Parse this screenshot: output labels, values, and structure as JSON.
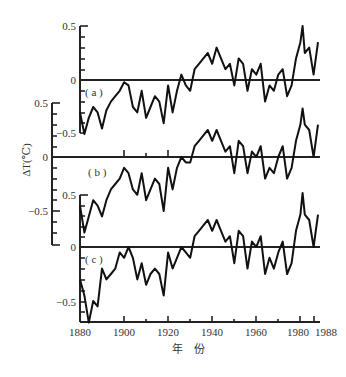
{
  "chart_data": {
    "type": "line",
    "title": "",
    "xlabel": "年　份",
    "ylabel": "ΔT(℃)",
    "x_ticks": [
      "1880",
      "1900",
      "1920",
      "1940",
      "1960",
      "1980",
      "1988"
    ],
    "xlim": [
      1880,
      1988
    ],
    "grid": false,
    "legend": null,
    "panels": [
      {
        "label": "(a)",
        "y_ticks": [
          "0.5",
          "0",
          "-0.5"
        ],
        "ylim": [
          -0.5,
          0.5
        ],
        "x": [
          1880,
          1882,
          1884,
          1886,
          1888,
          1890,
          1892,
          1894,
          1896,
          1898,
          1900,
          1902,
          1904,
          1906,
          1908,
          1910,
          1912,
          1914,
          1916,
          1918,
          1920,
          1922,
          1924,
          1926,
          1928,
          1930,
          1932,
          1934,
          1936,
          1938,
          1940,
          1942,
          1944,
          1946,
          1948,
          1950,
          1952,
          1954,
          1956,
          1958,
          1960,
          1962,
          1964,
          1966,
          1968,
          1970,
          1972,
          1974,
          1976,
          1978,
          1980,
          1981,
          1982,
          1984,
          1986,
          1988
        ],
        "values": [
          -0.3,
          -0.5,
          -0.35,
          -0.25,
          -0.3,
          -0.45,
          -0.28,
          -0.2,
          -0.15,
          -0.1,
          -0.02,
          -0.05,
          -0.25,
          -0.3,
          -0.1,
          -0.35,
          -0.25,
          -0.15,
          -0.2,
          -0.4,
          -0.05,
          -0.3,
          -0.1,
          0.05,
          -0.05,
          -0.1,
          0.1,
          0.15,
          0.2,
          0.25,
          0.15,
          0.3,
          0.2,
          0.1,
          0.15,
          -0.05,
          0.2,
          0.15,
          -0.1,
          0.1,
          0.05,
          0.15,
          -0.2,
          -0.05,
          -0.1,
          0.05,
          0.1,
          -0.15,
          -0.05,
          0.2,
          0.35,
          0.5,
          0.25,
          0.3,
          0.05,
          0.35
        ]
      },
      {
        "label": "(b)",
        "y_ticks": [
          "0.5",
          "0",
          "-0.5"
        ],
        "ylim": [
          -0.5,
          0.5
        ],
        "x": [
          1880,
          1882,
          1884,
          1886,
          1888,
          1890,
          1892,
          1894,
          1896,
          1898,
          1900,
          1902,
          1904,
          1906,
          1908,
          1910,
          1912,
          1914,
          1916,
          1918,
          1920,
          1922,
          1924,
          1926,
          1928,
          1930,
          1932,
          1934,
          1936,
          1938,
          1940,
          1942,
          1944,
          1946,
          1948,
          1950,
          1952,
          1954,
          1956,
          1958,
          1960,
          1962,
          1964,
          1966,
          1968,
          1970,
          1972,
          1974,
          1976,
          1978,
          1980,
          1981,
          1982,
          1984,
          1986,
          1988
        ],
        "values": [
          -0.45,
          -0.7,
          -0.55,
          -0.4,
          -0.45,
          -0.55,
          -0.4,
          -0.3,
          -0.25,
          -0.2,
          -0.1,
          -0.15,
          -0.3,
          -0.35,
          -0.15,
          -0.4,
          -0.3,
          -0.2,
          -0.25,
          -0.5,
          -0.1,
          -0.3,
          -0.1,
          0.0,
          -0.05,
          -0.05,
          0.1,
          0.15,
          0.2,
          0.25,
          0.15,
          0.25,
          0.15,
          0.05,
          0.1,
          -0.15,
          0.15,
          0.1,
          -0.15,
          0.05,
          0.0,
          0.1,
          -0.2,
          -0.1,
          -0.15,
          0.0,
          0.1,
          -0.2,
          -0.1,
          0.15,
          0.3,
          0.45,
          0.3,
          0.25,
          0.0,
          0.3
        ]
      },
      {
        "label": "(c)",
        "y_ticks": [
          "0.5",
          "0",
          "-0.5"
        ],
        "ylim": [
          -0.7,
          0.5
        ],
        "x": [
          1880,
          1882,
          1884,
          1886,
          1888,
          1890,
          1892,
          1894,
          1896,
          1898,
          1900,
          1902,
          1904,
          1906,
          1908,
          1910,
          1912,
          1914,
          1916,
          1918,
          1920,
          1922,
          1924,
          1926,
          1928,
          1930,
          1932,
          1934,
          1936,
          1938,
          1940,
          1942,
          1944,
          1946,
          1948,
          1950,
          1952,
          1954,
          1956,
          1958,
          1960,
          1962,
          1964,
          1966,
          1968,
          1970,
          1972,
          1974,
          1976,
          1978,
          1980,
          1981,
          1982,
          1984,
          1986,
          1988
        ],
        "values": [
          -0.3,
          -0.45,
          -0.7,
          -0.5,
          -0.55,
          -0.2,
          -0.3,
          -0.25,
          -0.2,
          -0.05,
          -0.1,
          0.0,
          -0.1,
          -0.3,
          -0.15,
          -0.35,
          -0.25,
          -0.2,
          -0.25,
          -0.45,
          -0.05,
          -0.2,
          -0.1,
          0.0,
          -0.05,
          -0.1,
          0.1,
          0.15,
          0.2,
          0.25,
          0.15,
          0.25,
          0.15,
          0.05,
          0.1,
          -0.15,
          0.15,
          0.1,
          -0.2,
          0.05,
          0.0,
          0.1,
          -0.25,
          -0.1,
          -0.2,
          -0.05,
          0.05,
          -0.25,
          -0.15,
          0.15,
          0.3,
          0.5,
          0.3,
          0.25,
          0.0,
          0.3
        ]
      }
    ]
  },
  "labels": {
    "ylabel": "ΔT(℃)",
    "xlabel": "年　份",
    "panel_a": "( a )",
    "panel_b": "( b )",
    "panel_c": "( c )",
    "tick_pos_half": "0.5",
    "tick_zero": "0",
    "tick_neg_half": "−0.5",
    "x_ticks": [
      "1880",
      "1900",
      "1920",
      "1940",
      "1960",
      "1980",
      "1988"
    ]
  }
}
